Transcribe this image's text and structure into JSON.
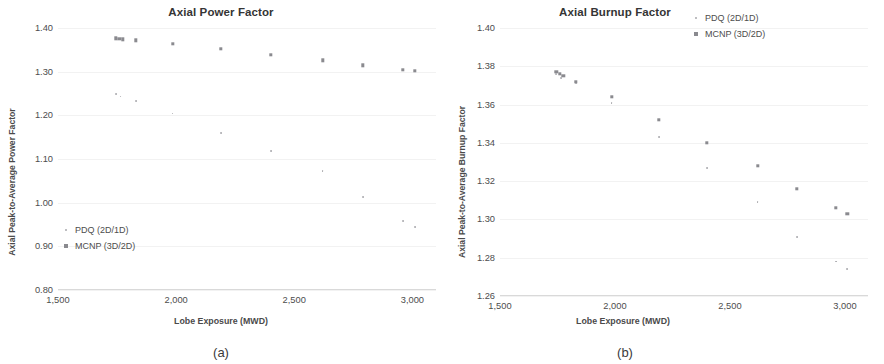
{
  "figure": {
    "panels": [
      {
        "key": "a",
        "caption": "(a)",
        "title": "Axial Power Factor",
        "xlabel": "Lobe Exposure (MWD)",
        "ylabel": "Axial Peak-to-Average Power Factor",
        "legend_position": "inside-bottom-left",
        "yticks": [
          "0.80",
          "0.90",
          "1.00",
          "1.10",
          "1.20",
          "1.30",
          "1.40"
        ],
        "xticks": [
          "1,500",
          "2,000",
          "2,500",
          "3,000"
        ],
        "legend": [
          {
            "label": "PDQ (2D/1D)",
            "marker": "dot-marker",
            "color": "#a9a9ad"
          },
          {
            "label": "MCNP (3D/2D)",
            "marker": "square-marker",
            "color": "#8a8a8f"
          }
        ]
      },
      {
        "key": "b",
        "caption": "(b)",
        "title": "Axial Burnup Factor",
        "xlabel": "Lobe Exposure (MWD)",
        "ylabel": "Axial Peak-to-Average Burnup Factor",
        "legend_position": "top-right",
        "yticks": [
          "1.26",
          "1.28",
          "1.30",
          "1.32",
          "1.34",
          "1.36",
          "1.38",
          "1.40"
        ],
        "xticks": [
          "1,500",
          "2,000",
          "2,500",
          "3,000"
        ],
        "legend": [
          {
            "label": "PDQ (2D/1D)",
            "marker": "dot-marker",
            "color": "#a9a9ad"
          },
          {
            "label": "MCNP (3D/2D)",
            "marker": "square-marker",
            "color": "#8a8a8f"
          }
        ]
      }
    ]
  },
  "chart_data": [
    {
      "type": "scatter",
      "panel": "a",
      "title": "Axial Power Factor",
      "xlabel": "Lobe Exposure (MWD)",
      "ylabel": "Axial Peak-to-Average Power Factor",
      "xlim": [
        1500,
        3100
      ],
      "ylim": [
        0.8,
        1.4
      ],
      "ytick_values": [
        0.8,
        0.9,
        1.0,
        1.1,
        1.2,
        1.3,
        1.4
      ],
      "xtick_values": [
        1500,
        2000,
        2500,
        3000
      ],
      "grid": false,
      "legend": [
        "PDQ (2D/1D)",
        "MCNP (3D/2D)"
      ],
      "series": [
        {
          "name": "MCNP (3D/2D)",
          "marker": "square",
          "color": "#8a8a8f",
          "x": [
            1745,
            1760,
            1775,
            1830,
            1985,
            2190,
            2400,
            2620,
            2790,
            2960,
            3010
          ],
          "y": [
            1.376,
            1.375,
            1.374,
            1.372,
            1.364,
            1.352,
            1.339,
            1.326,
            1.315,
            1.304,
            1.302
          ]
        },
        {
          "name": "PDQ (2D/1D)",
          "marker": "dot",
          "color": "#a9a9ad",
          "x": [
            1745,
            1765,
            1830,
            1985,
            2190,
            2400,
            2620,
            2790,
            2960,
            3010
          ],
          "y": [
            1.248,
            1.243,
            1.233,
            1.204,
            1.159,
            1.119,
            1.073,
            1.013,
            0.958,
            0.945
          ]
        }
      ]
    },
    {
      "type": "scatter",
      "panel": "b",
      "title": "Axial Burnup Factor",
      "xlabel": "Lobe Exposure (MWD)",
      "ylabel": "Axial Peak-to-Average Burnup Factor",
      "xlim": [
        1500,
        3100
      ],
      "ylim": [
        1.26,
        1.4
      ],
      "ytick_values": [
        1.26,
        1.28,
        1.3,
        1.32,
        1.34,
        1.36,
        1.38,
        1.4
      ],
      "xtick_values": [
        1500,
        2000,
        2500,
        3000
      ],
      "grid": false,
      "legend": [
        "PDQ (2D/1D)",
        "MCNP (3D/2D)"
      ],
      "series": [
        {
          "name": "MCNP (3D/2D)",
          "marker": "square",
          "color": "#8a8a8f",
          "x": [
            1745,
            1760,
            1775,
            1830,
            1985,
            2190,
            2400,
            2620,
            2790,
            2960,
            3010
          ],
          "y": [
            1.377,
            1.376,
            1.375,
            1.372,
            1.364,
            1.352,
            1.34,
            1.328,
            1.316,
            1.306,
            1.303
          ]
        },
        {
          "name": "PDQ (2D/1D)",
          "marker": "dot",
          "color": "#a9a9ad",
          "x": [
            1745,
            1765,
            1830,
            1985,
            2190,
            2400,
            2620,
            2790,
            2960,
            3010
          ],
          "y": [
            1.376,
            1.374,
            1.371,
            1.361,
            1.343,
            1.327,
            1.309,
            1.291,
            1.278,
            1.274
          ]
        }
      ]
    }
  ]
}
